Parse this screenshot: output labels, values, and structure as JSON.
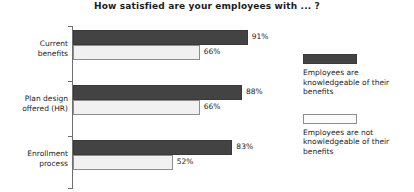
{
  "chart_data": {
    "type": "bar",
    "orientation": "horizontal",
    "title": "How satisfied are your employees with ... ?",
    "xlabel": "",
    "ylabel": "",
    "xlim": [
      0,
      100
    ],
    "grid": false,
    "legend_position": "right",
    "categories": [
      "Current benefits",
      "Plan design offered (HR)",
      "Enrollment process"
    ],
    "category_lines": [
      [
        "Current",
        "benefits"
      ],
      [
        "Plan design",
        "offered (HR)"
      ],
      [
        "Enrollment",
        "process"
      ]
    ],
    "series": [
      {
        "name": "Employees are knowledgeable of their benefits",
        "name_lines": [
          "Employees are",
          "knowledgeable of their",
          "benefits"
        ],
        "color": "#434343",
        "values": [
          91,
          88,
          83
        ],
        "labels": [
          "91%",
          "88%",
          "83%"
        ]
      },
      {
        "name": "Employees are not knowledgeable of their benefits",
        "name_lines": [
          "Employees are not",
          "knowledgeable of their",
          "benefits"
        ],
        "color": "#f1f1f1",
        "values": [
          66,
          66,
          52
        ],
        "labels": [
          "66%",
          "66%",
          "52%"
        ]
      }
    ]
  },
  "axis": {
    "line_color": "#6e6e6e"
  }
}
